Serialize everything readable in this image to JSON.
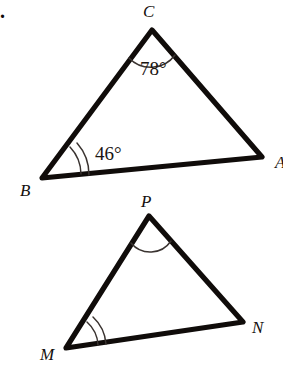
{
  "page": {
    "item_marker": ".",
    "background_color": "#ffffff",
    "ink_color": "#100c0a"
  },
  "figures": [
    {
      "name": "triangle-abc",
      "vertices": [
        {
          "label": "C",
          "x": 152,
          "y": 30,
          "label_x": 143,
          "label_y": 17
        },
        {
          "label": "A",
          "x": 262,
          "y": 157,
          "label_x": 275,
          "label_y": 168
        },
        {
          "label": "B",
          "x": 42,
          "y": 178,
          "label_x": 20,
          "label_y": 196
        }
      ],
      "angles": [
        {
          "at": "C",
          "value": "78°",
          "arcs": 1,
          "text_x": 140,
          "text_y": 75
        },
        {
          "at": "B",
          "value": "46°",
          "arcs": 2,
          "text_x": 95,
          "text_y": 160
        }
      ]
    },
    {
      "name": "triangle-mnp",
      "vertices": [
        {
          "label": "P",
          "x": 149,
          "y": 216,
          "label_x": 141,
          "label_y": 207
        },
        {
          "label": "N",
          "x": 243,
          "y": 322,
          "label_x": 252,
          "label_y": 333
        },
        {
          "label": "M",
          "x": 66,
          "y": 348,
          "label_x": 40,
          "label_y": 360
        }
      ],
      "angles": [
        {
          "at": "P",
          "value": "",
          "arcs": 1
        },
        {
          "at": "M",
          "value": "",
          "arcs": 2
        }
      ]
    }
  ]
}
